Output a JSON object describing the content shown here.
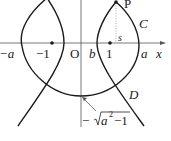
{
  "labels": {
    "point_p": "P",
    "curve_c": "C",
    "curve_d": "D",
    "s": "s",
    "neg_a": "−a",
    "neg_one": "−1",
    "origin": "O",
    "b": "b",
    "one": "1",
    "a": "a",
    "x_axis": "x",
    "intercept_prefix": "−",
    "intercept_radicand": "a",
    "intercept_exp": "2",
    "intercept_suffix": "−1"
  },
  "colors": {
    "curve": "#1a1a1a",
    "axis": "#555555",
    "dotted": "#999999"
  }
}
